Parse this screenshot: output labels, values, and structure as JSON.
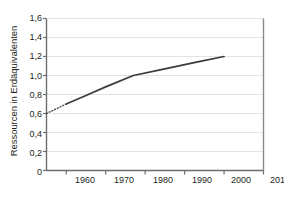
{
  "chart_data": {
    "type": "line",
    "title": "",
    "subtitle": "",
    "xlabel": "",
    "ylabel": "Ressourcen in Erdäquivalenten",
    "xlim": [
      1955,
      2010
    ],
    "ylim": [
      0,
      1.6
    ],
    "grid": true,
    "legend": "none",
    "x_ticks": [
      1960,
      1970,
      1980,
      1990,
      2000,
      2010
    ],
    "x_tick_labels": [
      "1960",
      "1970",
      "1980",
      "1990",
      "2000",
      "2010"
    ],
    "y_ticks": [
      0,
      0.2,
      0.4,
      0.6,
      0.8,
      1.0,
      1.2,
      1.4,
      1.6
    ],
    "y_tick_labels": [
      "0",
      "0,2",
      "0,4",
      "0,6",
      "0,8",
      "1,0",
      "1,2",
      "1,4",
      "1,6"
    ],
    "series": [
      {
        "name": "Ressourcenverbrauch",
        "style": "dotted",
        "x": [
          1955,
          1960
        ],
        "values": [
          0.6,
          0.7
        ]
      },
      {
        "name": "Ressourcenverbrauch",
        "style": "solid",
        "x": [
          1960,
          1965,
          1970,
          1977,
          1985,
          1993,
          2000
        ],
        "values": [
          0.7,
          0.79,
          0.88,
          1.0,
          1.07,
          1.14,
          1.2
        ]
      }
    ],
    "colors": {
      "line": "#3b3b3b",
      "grid": "#e3e3e3",
      "axis": "#6d6d6d",
      "frame": "#8a8a8a",
      "text": "#231f20",
      "background": "#ffffff"
    }
  },
  "axes": {
    "y_title": "Ressourcen in Erdäquivalenten",
    "y_labels": [
      "1,6",
      "1,4",
      "1,2",
      "1,0",
      "0,8",
      "0,6",
      "0,4",
      "0,2",
      "0"
    ],
    "x_labels": [
      "1960",
      "1970",
      "1980",
      "1990",
      "2000",
      "2010"
    ]
  }
}
